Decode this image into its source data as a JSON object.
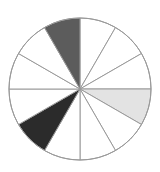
{
  "diagram": {
    "type": "fraction-circle",
    "total_sectors": 12,
    "center": [
      80,
      89
    ],
    "radius": 71,
    "start_angle_deg": 0,
    "direction": "clockwise",
    "outline_color": "#9a9a9a",
    "sectors": [
      {
        "index": 0,
        "fill": "#ffffff"
      },
      {
        "index": 1,
        "fill": "#ffffff"
      },
      {
        "index": 2,
        "fill": "#ffffff"
      },
      {
        "index": 3,
        "fill": "#e3e3e3"
      },
      {
        "index": 4,
        "fill": "#ffffff"
      },
      {
        "index": 5,
        "fill": "#ffffff"
      },
      {
        "index": 6,
        "fill": "#ffffff"
      },
      {
        "index": 7,
        "fill": "#2b2b2b"
      },
      {
        "index": 8,
        "fill": "#ffffff"
      },
      {
        "index": 9,
        "fill": "#ffffff"
      },
      {
        "index": 10,
        "fill": "#ffffff"
      },
      {
        "index": 11,
        "fill": "#5c5c5c"
      }
    ]
  }
}
